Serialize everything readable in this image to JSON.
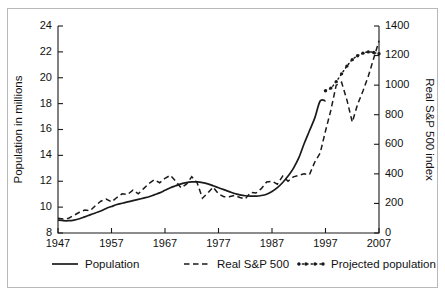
{
  "figure": {
    "border_color": "#b9b9b9",
    "background": "#ffffff",
    "line_color": "#1a1a1a"
  },
  "chart_data": {
    "type": "line",
    "title": "",
    "subtitle": "",
    "xlabel": "",
    "ylabel": "Population in millions",
    "y2label": "Real S&P 500 index",
    "xlim": [
      1947,
      2007
    ],
    "ylim": [
      8,
      24
    ],
    "y2lim": [
      0,
      1400
    ],
    "xticks": [
      1947,
      1957,
      1967,
      1977,
      1987,
      1997,
      2007
    ],
    "xtick_labels": [
      "1947",
      "1957",
      "1967",
      "1977",
      "1987",
      "1997",
      "2007"
    ],
    "yticks": [
      8,
      10,
      12,
      14,
      16,
      18,
      20,
      22,
      24
    ],
    "ytick_labels": [
      "8",
      "10",
      "12",
      "14",
      "16",
      "18",
      "20",
      "22",
      "24"
    ],
    "y2ticks": [
      0,
      200,
      400,
      600,
      800,
      1000,
      1200,
      1400
    ],
    "y2tick_labels": [
      "0",
      "200",
      "400",
      "600",
      "800",
      "1000",
      "1200",
      "1400"
    ],
    "grid": false,
    "legend_position": "below",
    "series": [
      {
        "name": "Population",
        "axis": "left",
        "style": "solid",
        "x": [
          1947,
          1948,
          1949,
          1950,
          1951,
          1952,
          1953,
          1954,
          1955,
          1956,
          1957,
          1958,
          1959,
          1960,
          1961,
          1962,
          1963,
          1964,
          1965,
          1966,
          1967,
          1968,
          1969,
          1970,
          1971,
          1972,
          1973,
          1974,
          1975,
          1976,
          1977,
          1978,
          1979,
          1980,
          1981,
          1982,
          1983,
          1984,
          1985,
          1986,
          1987,
          1988,
          1989,
          1990,
          1991,
          1992,
          1993,
          1994,
          1995,
          1996,
          1997
        ],
        "values": [
          9.0,
          8.95,
          8.95,
          9.0,
          9.1,
          9.25,
          9.4,
          9.55,
          9.7,
          9.9,
          10.05,
          10.2,
          10.3,
          10.4,
          10.5,
          10.6,
          10.7,
          10.8,
          10.95,
          11.1,
          11.3,
          11.5,
          11.65,
          11.8,
          11.9,
          11.95,
          11.95,
          11.9,
          11.8,
          11.65,
          11.5,
          11.35,
          11.2,
          11.05,
          10.95,
          10.88,
          10.85,
          10.85,
          10.9,
          11.0,
          11.2,
          11.5,
          11.9,
          12.4,
          13.0,
          13.8,
          14.9,
          15.9,
          16.9,
          18.2,
          18.2
        ]
      },
      {
        "name": "Real S&P 500",
        "axis": "right",
        "style": "dashed",
        "x": [
          1947,
          1948,
          1949,
          1950,
          1951,
          1952,
          1953,
          1954,
          1955,
          1956,
          1957,
          1958,
          1959,
          1960,
          1961,
          1962,
          1963,
          1964,
          1965,
          1966,
          1967,
          1968,
          1969,
          1970,
          1971,
          1972,
          1973,
          1974,
          1975,
          1976,
          1977,
          1978,
          1979,
          1980,
          1981,
          1982,
          1983,
          1984,
          1985,
          1986,
          1987,
          1988,
          1989,
          1990,
          1991,
          1992,
          1993,
          1994,
          1995,
          1996,
          1997,
          1998,
          1999,
          2000,
          2001,
          2002,
          2003,
          2004,
          2005,
          2006,
          2007
        ],
        "values": [
          100,
          95,
          100,
          120,
          140,
          155,
          150,
          185,
          215,
          230,
          210,
          240,
          265,
          260,
          290,
          265,
          300,
          335,
          360,
          340,
          370,
          390,
          350,
          305,
          330,
          380,
          340,
          235,
          270,
          310,
          265,
          245,
          245,
          255,
          240,
          230,
          275,
          270,
          300,
          345,
          350,
          330,
          385,
          350,
          380,
          390,
          400,
          395,
          480,
          540,
          690,
          830,
          1000,
          1020,
          900,
          750,
          870,
          960,
          1060,
          1180,
          1300
        ]
      },
      {
        "name": "Projected population",
        "axis": "left",
        "style": "dash-dot-markers",
        "x": [
          1997,
          1998,
          1999,
          2000,
          2001,
          2002,
          2003,
          2004,
          2005,
          2006,
          2007
        ],
        "values": [
          19.0,
          19.2,
          19.7,
          20.3,
          20.9,
          21.4,
          21.7,
          21.9,
          22.0,
          21.95,
          21.85
        ]
      }
    ],
    "legend": [
      {
        "label": "Population",
        "style": "solid"
      },
      {
        "label": "Real S&P 500",
        "style": "dashed"
      },
      {
        "label": "Projected population",
        "style": "dash-dot-markers"
      }
    ]
  }
}
